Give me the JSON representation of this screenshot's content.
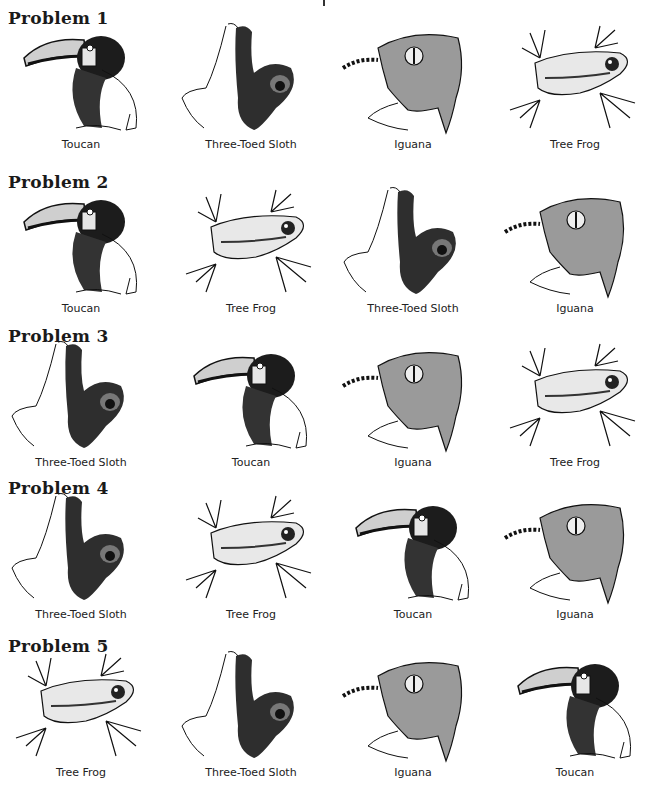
{
  "page": {
    "problems": [
      {
        "title": "Problem 1",
        "animals": [
          "Toucan",
          "Three-Toed Sloth",
          "Iguana",
          "Tree Frog"
        ]
      },
      {
        "title": "Problem 2",
        "animals": [
          "Toucan",
          "Tree Frog",
          "Three-Toed Sloth",
          "Iguana"
        ]
      },
      {
        "title": "Problem 3",
        "animals": [
          "Three-Toed Sloth",
          "Toucan",
          "Iguana",
          "Tree Frog"
        ]
      },
      {
        "title": "Problem 4",
        "animals": [
          "Three-Toed Sloth",
          "Tree Frog",
          "Toucan",
          "Iguana"
        ]
      },
      {
        "title": "Problem 5",
        "animals": [
          "Tree Frog",
          "Three-Toed Sloth",
          "Iguana",
          "Toucan"
        ]
      }
    ]
  }
}
